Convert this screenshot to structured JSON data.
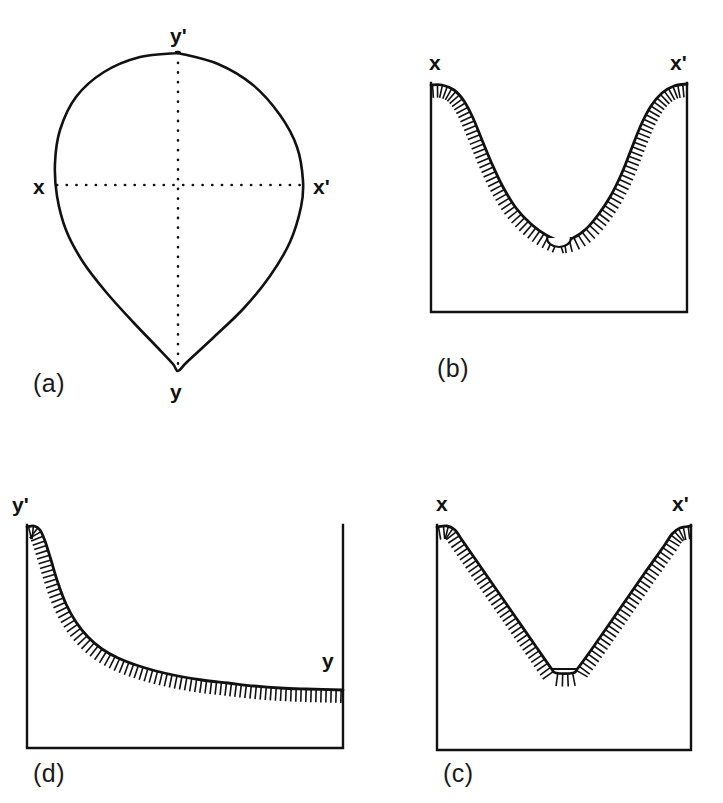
{
  "figure": {
    "background_color": "#ffffff",
    "ink_color": "#111111",
    "width": 723,
    "height": 803
  },
  "panels": [
    {
      "id": "a",
      "caption": "(a)",
      "caption_pos": [
        33,
        392
      ],
      "kind": "closed-outline-with-axes",
      "labels": [
        {
          "name": "y-prime-top",
          "text": "y'",
          "x": 170,
          "y": 43
        },
        {
          "name": "x-left",
          "text": "x",
          "x": 33,
          "y": 194
        },
        {
          "name": "x-prime-right",
          "text": "x'",
          "x": 313,
          "y": 194
        },
        {
          "name": "y-bottom",
          "text": "y",
          "x": 170,
          "y": 399
        }
      ],
      "outline_points": [
        [
          178,
          53
        ],
        [
          140,
          57
        ],
        [
          104,
          72
        ],
        [
          76,
          97
        ],
        [
          60,
          130
        ],
        [
          55,
          163
        ],
        [
          57,
          196
        ],
        [
          66,
          230
        ],
        [
          83,
          262
        ],
        [
          106,
          292
        ],
        [
          133,
          322
        ],
        [
          158,
          348
        ],
        [
          173,
          364
        ],
        [
          178,
          371
        ],
        [
          187,
          362
        ],
        [
          214,
          337
        ],
        [
          244,
          308
        ],
        [
          270,
          276
        ],
        [
          290,
          242
        ],
        [
          301,
          207
        ],
        [
          303,
          181
        ],
        [
          297,
          147
        ],
        [
          280,
          115
        ],
        [
          253,
          85
        ],
        [
          218,
          64
        ],
        [
          178,
          53
        ]
      ],
      "axes": {
        "horizontal": {
          "x1": 57,
          "y1": 185,
          "x2": 303,
          "y2": 185
        },
        "vertical": {
          "x1": 178,
          "y1": 53,
          "x2": 178,
          "y2": 371
        }
      }
    },
    {
      "id": "b",
      "caption": "(b)",
      "caption_pos": [
        437,
        377
      ],
      "kind": "u-shaped-profile",
      "frame": {
        "left": 431,
        "right": 687,
        "top": 83,
        "bottom": 312
      },
      "labels": [
        {
          "name": "x-left",
          "text": "x",
          "x": 429,
          "y": 70
        },
        {
          "name": "x-prime-right",
          "text": "x'",
          "x": 670,
          "y": 70
        }
      ],
      "curve_points": [
        [
          431,
          85
        ],
        [
          442,
          85
        ],
        [
          454,
          90
        ],
        [
          464,
          101
        ],
        [
          473,
          118
        ],
        [
          482,
          140
        ],
        [
          492,
          164
        ],
        [
          503,
          187
        ],
        [
          516,
          208
        ],
        [
          531,
          224
        ],
        [
          546,
          235
        ],
        [
          559,
          241
        ],
        [
          559,
          241
        ],
        [
          573,
          238
        ],
        [
          586,
          229
        ],
        [
          598,
          215
        ],
        [
          610,
          197
        ],
        [
          621,
          175
        ],
        [
          631,
          150
        ],
        [
          641,
          125
        ],
        [
          651,
          106
        ],
        [
          662,
          93
        ],
        [
          674,
          86
        ],
        [
          687,
          84
        ]
      ],
      "basin": {
        "cx": 559,
        "cy": 238,
        "rx": 12,
        "ry": 9
      },
      "hachure_length": 13
    },
    {
      "id": "c",
      "caption": "(c)",
      "caption_pos": [
        443,
        782
      ],
      "kind": "v-shaped-profile",
      "frame": {
        "left": 437,
        "right": 691,
        "top": 525,
        "bottom": 750
      },
      "labels": [
        {
          "name": "x-left",
          "text": "x",
          "x": 436,
          "y": 511
        },
        {
          "name": "x-prime-right",
          "text": "x'",
          "x": 672,
          "y": 511
        }
      ],
      "curve_points": [
        [
          437,
          527
        ],
        [
          447,
          526
        ],
        [
          455,
          530
        ],
        [
          462,
          540
        ],
        [
          487,
          576
        ],
        [
          512,
          612
        ],
        [
          537,
          648
        ],
        [
          551,
          668
        ],
        [
          556,
          673
        ],
        [
          573,
          673
        ],
        [
          578,
          668
        ],
        [
          594,
          646
        ],
        [
          619,
          610
        ],
        [
          644,
          574
        ],
        [
          664,
          546
        ],
        [
          672,
          534
        ],
        [
          680,
          528
        ],
        [
          691,
          526
        ]
      ],
      "basin": {
        "x1": 553,
        "y1": 669,
        "x2": 576,
        "y2": 669
      },
      "hachure_length": 13
    },
    {
      "id": "d",
      "caption": "(d)",
      "caption_pos": [
        33,
        782
      ],
      "kind": "decay-profile",
      "frame": {
        "left": 27,
        "right": 343,
        "top": 525,
        "bottom": 748
      },
      "labels": [
        {
          "name": "y-prime-left",
          "text": "y'",
          "x": 12,
          "y": 512
        },
        {
          "name": "y-right",
          "text": "y",
          "x": 322,
          "y": 668
        }
      ],
      "curve_points": [
        [
          27,
          527
        ],
        [
          34,
          526
        ],
        [
          40,
          530
        ],
        [
          45,
          541
        ],
        [
          51,
          560
        ],
        [
          58,
          583
        ],
        [
          66,
          604
        ],
        [
          76,
          622
        ],
        [
          88,
          637
        ],
        [
          102,
          649
        ],
        [
          118,
          658
        ],
        [
          136,
          665
        ],
        [
          156,
          671
        ],
        [
          178,
          676
        ],
        [
          202,
          680
        ],
        [
          228,
          683
        ],
        [
          254,
          686
        ],
        [
          280,
          688
        ],
        [
          306,
          689
        ],
        [
          343,
          690
        ]
      ],
      "hachure_length": 13
    }
  ]
}
